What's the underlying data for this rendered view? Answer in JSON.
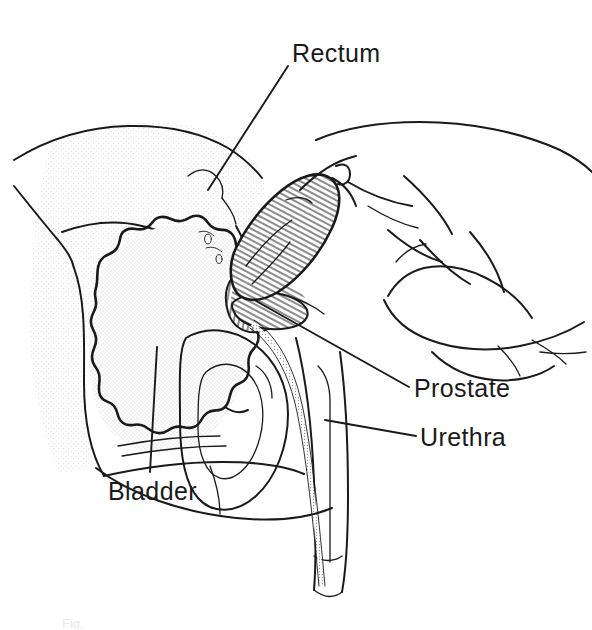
{
  "figure": {
    "type": "medical-line-illustration",
    "view": "sagittal section, male pelvis",
    "background_color": "#ffffff",
    "ink_color": "#1a1a1a",
    "stipple_color": "#d8d8d8",
    "width": 592,
    "height": 630,
    "caption": "Fig."
  },
  "labels": [
    {
      "id": "rectum",
      "text": "Rectum",
      "x": 292,
      "y": 62,
      "anchor": "start",
      "leader": "M 288 66 L 208 190"
    },
    {
      "id": "prostate",
      "text": "Prostate",
      "x": 414,
      "y": 397,
      "anchor": "start",
      "leader": "M 409 387 L 256 301"
    },
    {
      "id": "urethra",
      "text": "Urethra",
      "x": 420,
      "y": 446,
      "anchor": "start",
      "leader": "M 416 436 L 325 420"
    },
    {
      "id": "bladder",
      "text": "Bladder",
      "x": 108,
      "y": 500,
      "anchor": "start",
      "leader": "M 157 347 L 150 472"
    }
  ],
  "structures": [
    {
      "id": "pelvic-bone",
      "name": "Pelvic bone / sacrum",
      "shading": "stipple"
    },
    {
      "id": "bladder-organ",
      "name": "Urinary bladder",
      "shading": "stipple",
      "outline": "scalloped"
    },
    {
      "id": "prostate-gland",
      "name": "Prostate gland",
      "shading": "hatch"
    },
    {
      "id": "seminal-vesicle",
      "name": "Seminal vesicle",
      "shading": "hatch"
    },
    {
      "id": "rectum-canal",
      "name": "Rectum",
      "shading": "none"
    },
    {
      "id": "urethra-channel",
      "name": "Urethra",
      "shading": "stipple-line"
    },
    {
      "id": "penis",
      "name": "Penis",
      "shading": "none"
    },
    {
      "id": "scrotum-testis",
      "name": "Scrotum and testis",
      "shading": "none"
    },
    {
      "id": "examining-hand",
      "name": "Examining hand",
      "shading": "none"
    },
    {
      "id": "index-finger",
      "name": "Inserted index finger",
      "shading": "hatch"
    }
  ]
}
